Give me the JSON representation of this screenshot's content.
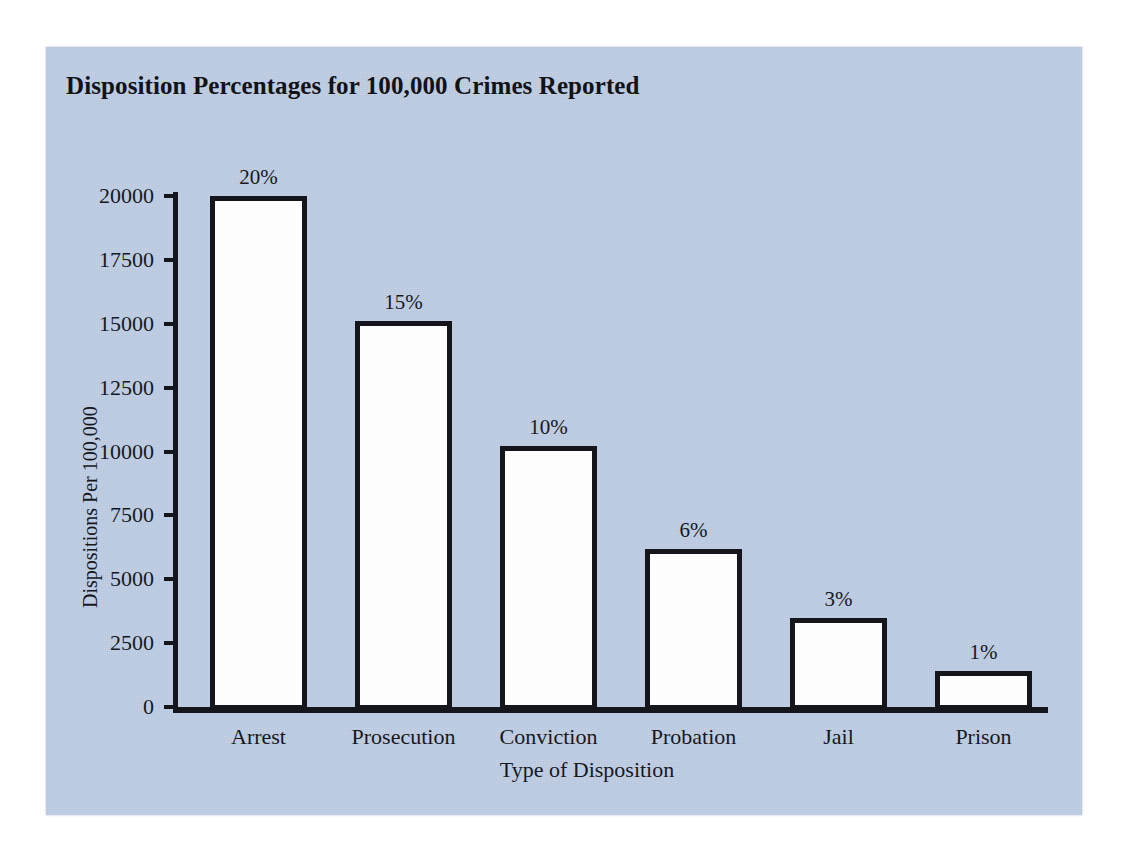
{
  "chart_data": {
    "type": "bar",
    "title": "Disposition Percentages for 100,000 Crimes Reported",
    "xlabel": "Type of Disposition",
    "ylabel": "Dispositions Per 100,000",
    "categories": [
      "Arrest",
      "Prosecution",
      "Conviction",
      "Probation",
      "Jail",
      "Prison"
    ],
    "values": [
      20000,
      15100,
      10200,
      6200,
      3500,
      1400
    ],
    "data_labels": [
      "20%",
      "15%",
      "10%",
      "6%",
      "3%",
      "1%"
    ],
    "ylim": [
      0,
      20000
    ],
    "yticks": [
      0,
      2500,
      5000,
      7500,
      10000,
      12500,
      15000,
      17500,
      20000
    ],
    "ytick_labels": [
      "0",
      "2500",
      "5000",
      "7500",
      "10000",
      "12500",
      "15000",
      "17500",
      "20000"
    ],
    "grid": false,
    "legend": false,
    "bar_fill_color": "#fdfdfd",
    "bar_edge_color": "#15161c",
    "panel_background_color": "#bccbe3",
    "page_background_color": "#ffffff",
    "text_color": "#16181e"
  }
}
